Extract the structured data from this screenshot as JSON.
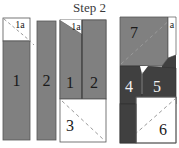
{
  "title": "Step 2",
  "figure": {
    "type": "geometric-dissection-diagram",
    "colors": {
      "mid_gray": "#808080",
      "dark_gray": "#404040",
      "white": "#ffffff",
      "outline": "#555555",
      "dashed": "#9a9a9a",
      "label_dark": "#1a1a1a",
      "label_light": "#f2f2f2"
    },
    "groups": [
      {
        "name": "left-group",
        "pieces": [
          {
            "label": "1",
            "fill": "mid_gray",
            "note": "tall rectangle with white square cap"
          },
          {
            "label": "1a",
            "fill": "white",
            "note": "small square with dashed diagonal"
          },
          {
            "label": "2",
            "fill": "mid_gray",
            "note": "tall rectangle"
          }
        ]
      },
      {
        "name": "middle-group",
        "pieces": [
          {
            "label": "1",
            "fill": "mid_gray",
            "note": "slanted-top piece"
          },
          {
            "label": "1a",
            "fill": "white",
            "note": "triangle at top-left"
          },
          {
            "label": "2",
            "fill": "mid_gray",
            "note": "rectangle"
          },
          {
            "label": "3",
            "fill": "white",
            "note": "square with dashed diagonal"
          }
        ]
      },
      {
        "name": "right-group",
        "pieces": [
          {
            "label": "7",
            "fill": "mid_gray",
            "note": "upper block with dashed diagonal"
          },
          {
            "label": "a",
            "fill": "white",
            "note": "thin sliver at top-right"
          },
          {
            "label": "4",
            "fill": "dark_gray",
            "note": "left lower block"
          },
          {
            "label": "5",
            "fill": "dark_gray",
            "note": "right lower block"
          },
          {
            "label": "6",
            "fill": "white",
            "note": "bottom-right square with dashed diagonal"
          }
        ]
      }
    ]
  },
  "labels": {
    "l1_1a": "1a",
    "l1_1": "1",
    "l1_2": "2",
    "m_1a": "1a",
    "m_1": "1",
    "m_2": "2",
    "m_3": "3",
    "r_7": "7",
    "r_a": "a",
    "r_4": "4",
    "r_5": "5",
    "r_6": "6"
  }
}
